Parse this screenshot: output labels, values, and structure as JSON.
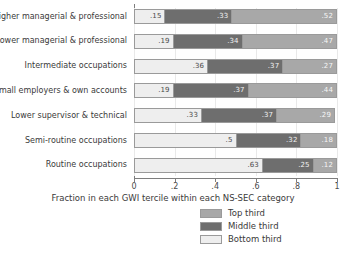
{
  "chart_data": {
    "type": "bar",
    "orientation": "horizontal",
    "stacked": true,
    "title": "",
    "xlabel": "Fraction in each GWI tercile within each NS-SEC category",
    "ylabel": "",
    "xlim": [
      0,
      1
    ],
    "xticks": [
      "0",
      ".2",
      ".4",
      ".6",
      ".8",
      "1"
    ],
    "xtick_values": [
      0,
      0.2,
      0.4,
      0.6,
      0.8,
      1
    ],
    "grid": true,
    "legend_position": "bottom-right",
    "categories": [
      "Higher managerial & professional",
      "Lower managerial & professional",
      "Intermediate occupations",
      "Small employers & own accounts",
      "Lower supervisor & technical",
      "Semi-routine occupations",
      "Routine occupations"
    ],
    "series": [
      {
        "name": "Bottom third",
        "color": "#eeeeee",
        "values": [
          0.15,
          0.19,
          0.36,
          0.19,
          0.33,
          0.5,
          0.63
        ],
        "labels": [
          ".15",
          ".19",
          ".36",
          ".19",
          ".33",
          ".5",
          ".63"
        ]
      },
      {
        "name": "Middle third",
        "color": "#6e6e6e",
        "values": [
          0.33,
          0.34,
          0.37,
          0.37,
          0.37,
          0.32,
          0.25
        ],
        "labels": [
          ".33",
          ".34",
          ".37",
          ".37",
          ".37",
          ".32",
          ".25"
        ]
      },
      {
        "name": "Top third",
        "color": "#a8a8a8",
        "values": [
          0.52,
          0.47,
          0.27,
          0.44,
          0.29,
          0.18,
          0.12
        ],
        "labels": [
          ".52",
          ".47",
          ".27",
          ".44",
          ".29",
          ".18",
          ".12"
        ]
      }
    ],
    "legend": [
      {
        "label": "Top third",
        "color": "#a8a8a8"
      },
      {
        "label": "Middle third",
        "color": "#6e6e6e"
      },
      {
        "label": "Bottom third",
        "color": "#eeeeee"
      }
    ]
  }
}
